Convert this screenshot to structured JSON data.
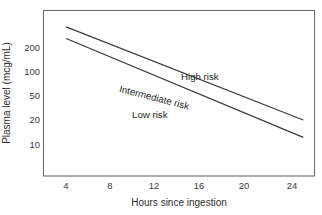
{
  "chart_data": {
    "type": "line",
    "title": "",
    "subtitle": "",
    "xlabel": "Hours since ingestion",
    "ylabel": "Plasma level (mcg/mL)",
    "yscale": "log",
    "xscale": "linear",
    "grid": false,
    "legend": false,
    "legend_position": "none",
    "xlim": [
      2,
      26
    ],
    "ylim": [
      5,
      300
    ],
    "xticks": [
      4,
      8,
      12,
      16,
      20,
      24
    ],
    "xticklabels": [
      "4",
      "8",
      "12",
      "16",
      "20",
      "24"
    ],
    "yticks": [
      200,
      100,
      50,
      20,
      10
    ],
    "yticklabels": [
      "200",
      "100",
      "50",
      "20",
      "10"
    ],
    "series": [
      {
        "name": "High risk boundary",
        "x": [
          4,
          25
        ],
        "values": [
          200,
          20
        ]
      },
      {
        "name": "Low risk boundary",
        "x": [
          4,
          25
        ],
        "values": [
          150,
          13
        ]
      }
    ],
    "annotations": [
      {
        "text": "High risk",
        "x": 16.5,
        "y": 105,
        "rotation": 0
      },
      {
        "text": "Intermediate risk",
        "x": 10.5,
        "y": 72,
        "rotation": -14.5
      },
      {
        "text": "Low risk",
        "x": 11.5,
        "y": 36,
        "rotation": 0
      }
    ],
    "colors": {
      "line": "#3a3a3a",
      "axis": "#6b6b6b",
      "text": "#2e2e2e",
      "background": "#ffffff"
    }
  },
  "axes": {
    "y_title": "Plasma level (mcg/mL)",
    "x_title": "Hours since ingestion",
    "y_ticks": [
      {
        "label": "200",
        "top": 48
      },
      {
        "label": "100",
        "top": 72
      },
      {
        "label": "50",
        "top": 96
      },
      {
        "label": "20",
        "top": 120
      },
      {
        "label": "10",
        "top": 145
      }
    ],
    "x_ticks": [
      {
        "label": "4",
        "left": 66
      },
      {
        "label": "8",
        "left": 110
      },
      {
        "label": "12",
        "left": 154
      },
      {
        "label": "16",
        "left": 199
      },
      {
        "label": "20",
        "left": 244
      },
      {
        "label": "24",
        "left": 292
      }
    ]
  },
  "zones": {
    "high": "High risk",
    "intermediate": "Intermediate risk",
    "low": "Low risk"
  }
}
